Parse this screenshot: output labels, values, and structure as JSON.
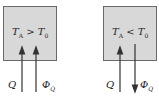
{
  "panels": [
    {
      "condition": {
        "T": "T",
        "sub_a": "A",
        "op": " > ",
        "T0": "T",
        "sub_0": "0"
      },
      "arrow_left": {
        "label": "Q",
        "direction": "up"
      },
      "arrow_right": {
        "label": "Φ",
        "sub": "Q",
        "direction": "up"
      }
    },
    {
      "condition": {
        "T": "T",
        "sub_a": "A",
        "op": " < ",
        "T0": "T",
        "sub_0": "0"
      },
      "arrow_left": {
        "label": "Q",
        "direction": "up"
      },
      "arrow_right": {
        "label": "Φ",
        "sub": "Q",
        "direction": "down"
      }
    }
  ],
  "colors": {
    "box_fill": "#d8d8d8",
    "box_border": "#6a6a6a",
    "arrow": "#333333"
  }
}
